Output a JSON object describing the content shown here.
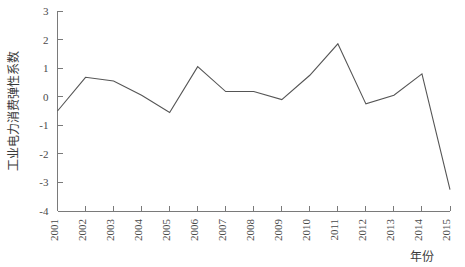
{
  "chart_data": {
    "type": "line",
    "title": "",
    "subtitle": "",
    "xlabel": "年份",
    "ylabel": "工业电力消费弹性系数",
    "categories": [
      "2001",
      "2002",
      "2003",
      "2004",
      "2005",
      "2006",
      "2007",
      "2008",
      "2009",
      "2010",
      "2011",
      "2012",
      "2013",
      "2014",
      "2015"
    ],
    "x": [
      2001,
      2002,
      2003,
      2004,
      2005,
      2006,
      2007,
      2008,
      2009,
      2010,
      2011,
      2012,
      2013,
      2014,
      2015
    ],
    "values": [
      -0.5,
      0.68,
      0.55,
      0.05,
      -0.55,
      1.05,
      0.18,
      0.18,
      -0.1,
      0.75,
      1.85,
      -0.25,
      0.05,
      0.8,
      -3.25
    ],
    "series": [
      {
        "name": "工业电力消费弹性系数",
        "values": [
          -0.5,
          0.68,
          0.55,
          0.05,
          -0.55,
          1.05,
          0.18,
          0.18,
          -0.1,
          0.75,
          1.85,
          -0.25,
          0.05,
          0.8,
          -3.25
        ]
      }
    ],
    "ylim": [
      -4,
      3
    ],
    "xlim": [
      2001,
      2015
    ],
    "ytick_labels": [
      "3",
      "2",
      "1",
      "0",
      "-1",
      "-2",
      "-3",
      "-4"
    ],
    "ytick_values": [
      3,
      2,
      1,
      0,
      -1,
      -2,
      -3,
      -4
    ],
    "xtick_labels": [
      "2001",
      "2002",
      "2003",
      "2004",
      "2005",
      "2006",
      "2007",
      "2008",
      "2009",
      "2010",
      "2011",
      "2012",
      "2013",
      "2014",
      "2015"
    ],
    "grid": false,
    "legend": false,
    "legend_position": "none",
    "line_color": "#555555",
    "axis_color": "#7a7a7a",
    "background_color": "#ffffff",
    "annotations": []
  },
  "axes": {
    "y_axis_title": "工业电力消费弹性系数",
    "x_axis_title": "年份"
  }
}
